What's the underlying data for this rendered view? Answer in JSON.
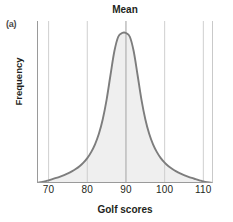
{
  "figure": {
    "panel_label": "(a)",
    "title": "Mean",
    "xlabel": "Golf scores",
    "ylabel": "Frequency"
  },
  "colors": {
    "curve": "#7d7d7d",
    "fill": "#efefef",
    "gridline": "#c9c9c9",
    "axis": "#8a8a8a",
    "text": "#231f20",
    "background": "#ffffff"
  },
  "chart_data": {
    "type": "line",
    "title": "Mean",
    "xlabel": "Golf scores",
    "ylabel": "Frequency",
    "xlim": [
      67,
      112.5
    ],
    "ylim": [
      0,
      1.08
    ],
    "xticks": [
      70,
      80,
      90,
      100,
      110
    ],
    "xtick_labels": [
      "70",
      "80",
      "90",
      "100",
      "110"
    ],
    "yticks": [],
    "ytick_labels": [],
    "grid": "vertical",
    "legend": "none",
    "annotations": [
      {
        "text": "Mean",
        "x": 90,
        "note": "label above the vertical line marking the distribution mean at x = 90"
      },
      {
        "text": "(a)",
        "note": "panel identifier, top-left of figure"
      }
    ],
    "series": [
      {
        "name": "Golf score distribution",
        "fill": true,
        "description": "Symmetric leptokurtic (peaked, heavy-tailed) frequency distribution centered on a mean of 90",
        "x": [
          67,
          68,
          69,
          70,
          71,
          72,
          73,
          74,
          75,
          76,
          77,
          78,
          79,
          80,
          81,
          82,
          83,
          84,
          85,
          86,
          87,
          88,
          89,
          90,
          91,
          92,
          93,
          94,
          95,
          96,
          97,
          98,
          99,
          100,
          101,
          102,
          103,
          104,
          105,
          106,
          107,
          108,
          109,
          110,
          111,
          112.5
        ],
        "y": [
          0.0,
          0.005,
          0.01,
          0.018,
          0.026,
          0.034,
          0.043,
          0.053,
          0.064,
          0.077,
          0.093,
          0.112,
          0.136,
          0.166,
          0.206,
          0.258,
          0.328,
          0.425,
          0.556,
          0.72,
          0.878,
          0.975,
          1.0,
          1.0,
          0.975,
          0.878,
          0.72,
          0.556,
          0.425,
          0.328,
          0.258,
          0.206,
          0.166,
          0.136,
          0.112,
          0.093,
          0.077,
          0.064,
          0.053,
          0.043,
          0.034,
          0.026,
          0.018,
          0.01,
          0.005,
          0.0
        ]
      }
    ],
    "mean_line": {
      "x": 90,
      "label": "Mean"
    }
  },
  "ticks": [
    {
      "label": "70",
      "x": 70
    },
    {
      "label": "80",
      "x": 80
    },
    {
      "label": "90",
      "x": 90
    },
    {
      "label": "100",
      "x": 100
    },
    {
      "label": "110",
      "x": 110
    }
  ]
}
